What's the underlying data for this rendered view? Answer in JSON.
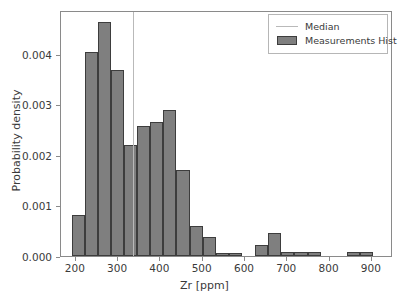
{
  "chart_data": {
    "type": "bar",
    "title": "",
    "subtitle": "",
    "xlabel": "Zr [ppm]",
    "ylabel": "Probability density",
    "xlim": [
      165,
      950
    ],
    "ylim": [
      0.0,
      0.00486
    ],
    "grid": false,
    "legend_position": "upper right",
    "bin_width": 31,
    "bin_edges": [
      190,
      221,
      252,
      283,
      314,
      345,
      376,
      407,
      438,
      469,
      500,
      531,
      562,
      593,
      624,
      655,
      686,
      717,
      748,
      779,
      810,
      841,
      872,
      903,
      920
    ],
    "bin_centers": [
      205,
      236,
      267,
      298,
      329,
      360,
      391,
      422,
      453,
      484,
      515,
      546,
      577,
      608,
      639,
      670,
      701,
      732,
      763,
      794,
      825,
      856,
      887,
      911
    ],
    "values": [
      0.00082,
      0.00404,
      0.00462,
      0.00368,
      0.0022,
      0.00257,
      0.00265,
      0.00288,
      0.0017,
      0.00059,
      0.00037,
      6e-05,
      6e-05,
      0.0,
      0.00022,
      0.00045,
      7e-05,
      7e-05,
      7e-05,
      0.0,
      0.0,
      7e-05,
      7e-05,
      0.0
    ],
    "series": [
      {
        "name": "Measurements Hist",
        "color": "#7f7f7f",
        "edge_color": "#3d3d3d",
        "values": [
          0.00082,
          0.00404,
          0.00462,
          0.00368,
          0.0022,
          0.00257,
          0.00265,
          0.00288,
          0.0017,
          0.00059,
          0.00037,
          6e-05,
          6e-05,
          0.0,
          0.00022,
          0.00045,
          7e-05,
          7e-05,
          7e-05,
          0.0,
          0.0,
          7e-05,
          7e-05,
          0.0
        ]
      }
    ],
    "annotations": [
      {
        "name": "median",
        "type": "vline",
        "x": 335,
        "color": "#b9b9b9",
        "label": "Median"
      }
    ],
    "xticks": [
      200,
      300,
      400,
      500,
      600,
      700,
      800,
      900
    ],
    "xticklabels": [
      "200",
      "300",
      "400",
      "500",
      "600",
      "700",
      "800",
      "900"
    ],
    "yticks": [
      0.0,
      0.001,
      0.002,
      0.003,
      0.004
    ],
    "yticklabels": [
      "0.000",
      "0.001",
      "0.002",
      "0.003",
      "0.004"
    ],
    "legend": [
      {
        "label": "Median",
        "key": "line",
        "color": "#b9b9b9"
      },
      {
        "label": "Measurements Hist",
        "key": "patch",
        "color": "#7f7f7f"
      }
    ]
  }
}
